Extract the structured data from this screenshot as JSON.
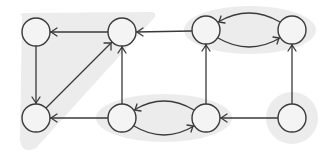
{
  "diagram": {
    "type": "directed-graph",
    "colors": {
      "background": "#ffffff",
      "component_shade": "#ececec",
      "node_fill": "#f4f4f4",
      "stroke": "#3a3a3a"
    },
    "node_radius": 14,
    "nodes": [
      {
        "id": "A",
        "x": 36,
        "y": 32
      },
      {
        "id": "B",
        "x": 122,
        "y": 32
      },
      {
        "id": "C",
        "x": 206,
        "y": 30
      },
      {
        "id": "D",
        "x": 292,
        "y": 30
      },
      {
        "id": "E",
        "x": 36,
        "y": 118
      },
      {
        "id": "F",
        "x": 122,
        "y": 118
      },
      {
        "id": "G",
        "x": 206,
        "y": 118
      },
      {
        "id": "H",
        "x": 292,
        "y": 118
      }
    ],
    "edges": [
      {
        "from": "B",
        "to": "A",
        "shape": "straight"
      },
      {
        "from": "C",
        "to": "B",
        "shape": "straight"
      },
      {
        "from": "A",
        "to": "E",
        "shape": "straight"
      },
      {
        "from": "E",
        "to": "B",
        "shape": "straight"
      },
      {
        "from": "F",
        "to": "B",
        "shape": "straight"
      },
      {
        "from": "F",
        "to": "E",
        "shape": "straight"
      },
      {
        "from": "G",
        "to": "F",
        "shape": "curved-upper"
      },
      {
        "from": "F",
        "to": "G",
        "shape": "curved-lower"
      },
      {
        "from": "G",
        "to": "C",
        "shape": "straight"
      },
      {
        "from": "D",
        "to": "C",
        "shape": "curved-upper"
      },
      {
        "from": "C",
        "to": "D",
        "shape": "curved-lower"
      },
      {
        "from": "H",
        "to": "G",
        "shape": "straight"
      },
      {
        "from": "H",
        "to": "D",
        "shape": "straight"
      }
    ],
    "components": [
      {
        "id": "scc-1",
        "nodes": [
          "A",
          "B",
          "E"
        ],
        "shape": "triangle"
      },
      {
        "id": "scc-2",
        "nodes": [
          "C",
          "D"
        ],
        "shape": "ellipse"
      },
      {
        "id": "scc-3",
        "nodes": [
          "F",
          "G"
        ],
        "shape": "ellipse"
      },
      {
        "id": "scc-4",
        "nodes": [
          "H"
        ],
        "shape": "circle"
      }
    ]
  }
}
